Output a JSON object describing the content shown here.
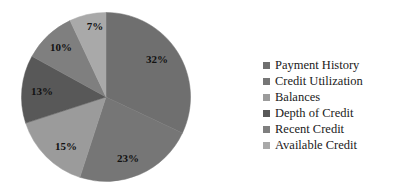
{
  "chart_data": {
    "type": "pie",
    "title": "",
    "subtitle": "",
    "xlabel": "",
    "ylabel": "",
    "grid": false,
    "legend_position": "right",
    "start_angle_deg": 0,
    "direction": "clockwise",
    "categories": [
      "Payment History",
      "Credit Utilization",
      "Balances",
      "Depth of Credit",
      "Recent Credit",
      "Available Credit"
    ],
    "values": [
      32,
      23,
      15,
      13,
      10,
      7
    ],
    "value_unit": "%",
    "data_labels": [
      "32%",
      "23%",
      "15%",
      "13%",
      "10%",
      "7%"
    ],
    "colors": [
      "#6f6f6f",
      "#767676",
      "#9b9b9b",
      "#585858",
      "#7f7f7f",
      "#a9a9a9"
    ],
    "total": 100
  },
  "pie": {
    "center_x": 106,
    "center_y": 97,
    "radius": 84.5,
    "slices": [
      {
        "name": "Payment History",
        "label": "32%",
        "value": 32,
        "color": "#6f6f6f",
        "label_x": 157,
        "label_y": 59
      },
      {
        "name": "Credit Utilization",
        "label": "23%",
        "value": 23,
        "color": "#767676",
        "label_x": 128,
        "label_y": 158
      },
      {
        "name": "Balances",
        "label": "15%",
        "value": 15,
        "color": "#9b9b9b",
        "label_x": 66,
        "label_y": 146
      },
      {
        "name": "Depth of Credit",
        "label": "13%",
        "value": 13,
        "color": "#585858",
        "label_x": 42,
        "label_y": 91
      },
      {
        "name": "Recent Credit",
        "label": "10%",
        "value": 10,
        "color": "#7f7f7f",
        "label_x": 61,
        "label_y": 47
      },
      {
        "name": "Available Credit",
        "label": "7%",
        "value": 7,
        "color": "#a9a9a9",
        "label_x": 95,
        "label_y": 26
      }
    ]
  },
  "legend": {
    "items": [
      {
        "label": "Payment History",
        "color": "#6f6f6f"
      },
      {
        "label": "Credit Utilization",
        "color": "#767676"
      },
      {
        "label": "Balances",
        "color": "#9b9b9b"
      },
      {
        "label": "Depth of Credit",
        "color": "#585858"
      },
      {
        "label": "Recent Credit",
        "color": "#7f7f7f"
      },
      {
        "label": "Available Credit",
        "color": "#a9a9a9"
      }
    ]
  }
}
